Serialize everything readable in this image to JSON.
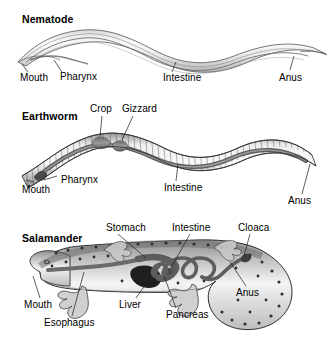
{
  "figure": {
    "kind": "comparative-anatomy-diagram",
    "background_color": "#ffffff",
    "ink_color": "#000000",
    "style": "grayscale line art with shading"
  },
  "panels": [
    {
      "id": "nematode",
      "title": "Nematode",
      "labels": [
        {
          "key": "mouth",
          "text": "Mouth"
        },
        {
          "key": "pharynx",
          "text": "Pharynx"
        },
        {
          "key": "intestine",
          "text": "Intestine"
        },
        {
          "key": "anus",
          "text": "Anus"
        }
      ]
    },
    {
      "id": "earthworm",
      "title": "Earthworm",
      "labels": [
        {
          "key": "crop",
          "text": "Crop"
        },
        {
          "key": "gizzard",
          "text": "Gizzard"
        },
        {
          "key": "mouth",
          "text": "Mouth"
        },
        {
          "key": "pharynx",
          "text": "Pharynx"
        },
        {
          "key": "intestine",
          "text": "Intestine"
        },
        {
          "key": "anus",
          "text": "Anus"
        }
      ]
    },
    {
      "id": "salamander",
      "title": "Salamander",
      "labels": [
        {
          "key": "stomach",
          "text": "Stomach"
        },
        {
          "key": "intestine",
          "text": "Intestine"
        },
        {
          "key": "cloaca",
          "text": "Cloaca"
        },
        {
          "key": "mouth",
          "text": "Mouth"
        },
        {
          "key": "esophagus",
          "text": "Esophagus"
        },
        {
          "key": "liver",
          "text": "Liver"
        },
        {
          "key": "pancreas",
          "text": "Pancreas"
        },
        {
          "key": "anus",
          "text": "Anus"
        }
      ]
    }
  ]
}
